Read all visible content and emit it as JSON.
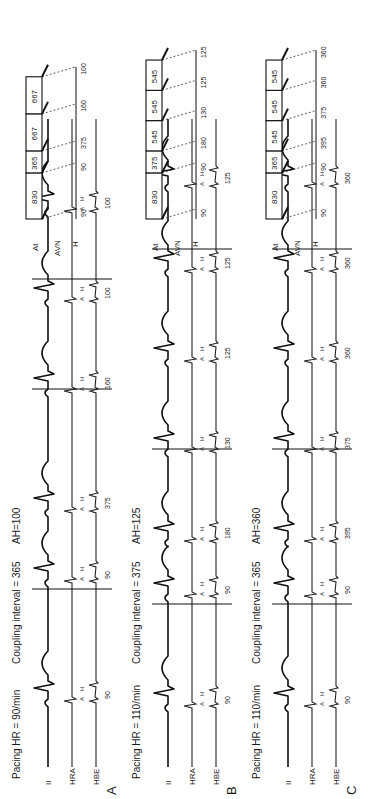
{
  "figure": {
    "orientation": "rotated-90-ccw",
    "panels": [
      {
        "letter": "A",
        "pacing_label": "Pacing HR = 90/min",
        "coupling_label": "Coupling interval = 365",
        "ah_label": "AH=100",
        "leads": [
          "II",
          "HRA",
          "HBE"
        ],
        "tracing_h_labels": [
          "90",
          "90",
          "375",
          "160",
          "100",
          "100"
        ],
        "ladder": {
          "row_labels": [
            "At",
            "AVN",
            "H"
          ],
          "atrial_intervals": [
            "830",
            "365",
            "667",
            "667"
          ],
          "ah_values": [
            "90",
            "90",
            "375",
            "160",
            "100"
          ]
        }
      },
      {
        "letter": "B",
        "pacing_label": "Pacing HR = 110/min",
        "coupling_label": "Coupling interval = 375",
        "ah_label": "AH=125",
        "leads": [
          "II",
          "HRA",
          "HBE"
        ],
        "tracing_h_labels": [
          "90",
          "90",
          "180",
          "130",
          "125",
          "125",
          "125"
        ],
        "ladder": {
          "row_labels": [
            "At",
            "AVN",
            "H"
          ],
          "atrial_intervals": [
            "830",
            "375",
            "545",
            "545",
            "545"
          ],
          "ah_values": [
            "90",
            "90",
            "180",
            "130",
            "125",
            "125"
          ]
        }
      },
      {
        "letter": "C",
        "pacing_label": "Pacing HR = 110/min",
        "coupling_label": "Coupling interval = 365",
        "ah_label": "AH=360",
        "leads": [
          "II",
          "HRA",
          "HBE"
        ],
        "tracing_h_labels": [
          "90",
          "90",
          "395",
          "375",
          "360",
          "360",
          "360"
        ],
        "ladder": {
          "row_labels": [
            "At",
            "AVN",
            "H"
          ],
          "atrial_intervals": [
            "830",
            "365",
            "545",
            "545",
            "545"
          ],
          "ah_values": [
            "90",
            "90",
            "395",
            "375",
            "360",
            "360"
          ]
        }
      }
    ],
    "wave_labels": {
      "atrial": "A",
      "his": "H"
    }
  }
}
